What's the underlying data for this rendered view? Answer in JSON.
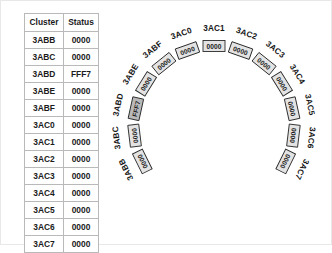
{
  "table": {
    "columns": [
      "Cluster",
      "Status"
    ],
    "rows": [
      {
        "cluster": "3ABB",
        "status": "0000"
      },
      {
        "cluster": "3ABC",
        "status": "0000"
      },
      {
        "cluster": "3ABD",
        "status": "FFF7"
      },
      {
        "cluster": "3ABE",
        "status": "0000"
      },
      {
        "cluster": "3ABF",
        "status": "0000"
      },
      {
        "cluster": "3AC0",
        "status": "0000"
      },
      {
        "cluster": "3AC1",
        "status": "0000"
      },
      {
        "cluster": "3AC2",
        "status": "0000"
      },
      {
        "cluster": "3AC3",
        "status": "0000"
      },
      {
        "cluster": "3AC4",
        "status": "0000"
      },
      {
        "cluster": "3AC5",
        "status": "0000"
      },
      {
        "cluster": "3AC6",
        "status": "0000"
      },
      {
        "cluster": "3AC7",
        "status": "0000"
      }
    ]
  },
  "ring": {
    "center_watermark": "",
    "segments": [
      {
        "label": "3ABB",
        "value": "0000",
        "flagged": false
      },
      {
        "label": "3ABC",
        "value": "0000",
        "flagged": false
      },
      {
        "label": "3ABD",
        "value": "FFF7",
        "flagged": true
      },
      {
        "label": "3ABE",
        "value": "0000",
        "flagged": false
      },
      {
        "label": "3ABF",
        "value": "0000",
        "flagged": false
      },
      {
        "label": "3AC0",
        "value": "0000",
        "flagged": false
      },
      {
        "label": "3AC1",
        "value": "0000",
        "flagged": false
      },
      {
        "label": "3AC2",
        "value": "0000",
        "flagged": false
      },
      {
        "label": "3AC3",
        "value": "0000",
        "flagged": false
      },
      {
        "label": "3AC4",
        "value": "0000",
        "flagged": false
      },
      {
        "label": "3AC5",
        "value": "0000",
        "flagged": false
      },
      {
        "label": "3AC6",
        "value": "0000",
        "flagged": false
      },
      {
        "label": "3AC7",
        "value": "0000",
        "flagged": false
      }
    ],
    "geometry": {
      "cx": 115,
      "cy": 125,
      "radius": 80,
      "start_angle_deg": 216,
      "end_angle_deg": -36,
      "box_length": 22,
      "box_width": 11,
      "label_offset": 18
    },
    "colors": {
      "segment_fill": "#e3e3e3",
      "segment_flagged_fill": "#b9b9b9",
      "segment_stroke": "#2a2a2a",
      "text": "#1b1b1b"
    }
  }
}
